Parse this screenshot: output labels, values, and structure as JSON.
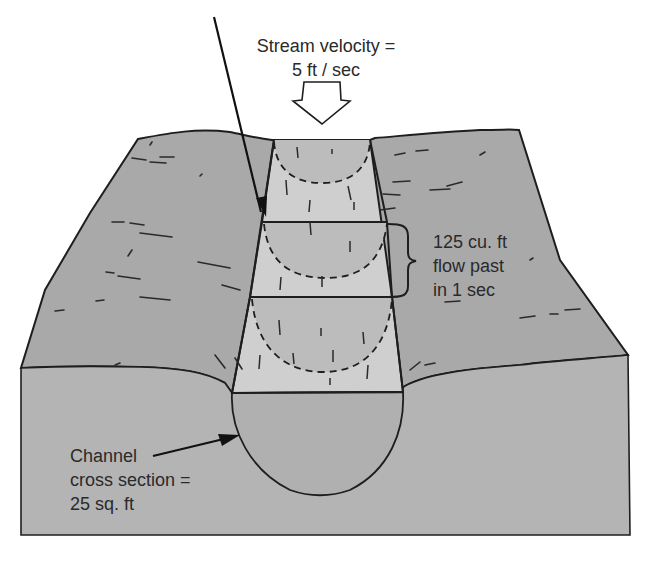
{
  "diagram": {
    "title_line1": "Stream velocity =",
    "title_line2": "5 ft / sec",
    "flow_label": {
      "line1": "125 cu. ft",
      "line2": "flow past",
      "line3": "in 1 sec"
    },
    "cross_section_label": {
      "line1": "Channel",
      "line2": "cross section =",
      "line3": "25 sq. ft"
    },
    "icons": {
      "flow_direction": "hollow-down-arrow-icon",
      "pointer": "leader-arrow-icon",
      "brace": "curly-brace-icon"
    },
    "colors": {
      "background": "#ffffff",
      "land_surface": "#a9a9a9",
      "front_face": "#b4b4b4",
      "water_surface": "#cfcfcf",
      "water_section": "#b0b0b0",
      "outline": "#1e1e1e",
      "text": "#2a2a2a"
    }
  }
}
